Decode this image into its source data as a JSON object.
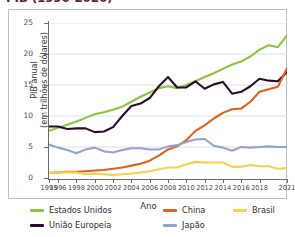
{
  "chart_title": "PIB (1990-2020)",
  "axis": {
    "ylabel": "PIB anual\n(em trilhões de dólares)",
    "xlabel": "Ano",
    "yticks": [
      "0",
      "5",
      "10",
      "15",
      "20",
      "25"
    ],
    "xticks": [
      "1995",
      "1996",
      "1998",
      "2000",
      "2002",
      "2004",
      "2006",
      "2008",
      "2010",
      "2012",
      "2014",
      "2016",
      "2018",
      "2021"
    ]
  },
  "legend": {
    "items": [
      {
        "label": "Estados Unidos",
        "color": "#8CC63F"
      },
      {
        "label": "China",
        "color": "#E2601B"
      },
      {
        "label": "Brasil",
        "color": "#F5D34B"
      },
      {
        "label": "União Europeia",
        "color": "#2B0B2E"
      },
      {
        "label": "Japão",
        "color": "#94A3CC"
      }
    ]
  },
  "chart_data": {
    "type": "line",
    "title": "PIB (1990-2020)",
    "xlabel": "Ano",
    "ylabel": "PIB anual (em trilhões de dólares)",
    "ylim": [
      0,
      25
    ],
    "xlim": [
      1995,
      2021
    ],
    "grid": true,
    "grid_axis": "y",
    "legend_position": "bottom",
    "ytick_values": [
      0,
      5,
      10,
      15,
      20,
      25
    ],
    "xtick_values": [
      1995,
      1996,
      1998,
      2000,
      2002,
      2004,
      2006,
      2008,
      2010,
      2012,
      2014,
      2016,
      2018,
      2021
    ],
    "x": [
      1995,
      1996,
      1997,
      1998,
      1999,
      2000,
      2001,
      2002,
      2003,
      2004,
      2005,
      2006,
      2007,
      2008,
      2009,
      2010,
      2011,
      2012,
      2013,
      2014,
      2015,
      2016,
      2017,
      2018,
      2019,
      2020,
      2021
    ],
    "series": [
      {
        "name": "Estados Unidos",
        "color": "#8CC63F",
        "values": [
          7.6,
          8.1,
          8.6,
          9.1,
          9.7,
          10.3,
          10.6,
          11.0,
          11.5,
          12.3,
          13.1,
          13.8,
          14.5,
          14.8,
          14.5,
          15.0,
          15.6,
          16.3,
          16.9,
          17.6,
          18.3,
          18.8,
          19.6,
          20.7,
          21.4,
          21.1,
          23.0
        ]
      },
      {
        "name": "União Europeia",
        "color": "#2B0B2E",
        "values": [
          8.3,
          8.3,
          7.9,
          8.0,
          8.0,
          7.4,
          7.5,
          8.2,
          10.0,
          11.6,
          12.0,
          12.9,
          14.8,
          16.3,
          14.6,
          14.6,
          15.6,
          14.4,
          15.1,
          15.5,
          13.6,
          13.9,
          14.8,
          16.0,
          15.7,
          15.6,
          17.1
        ]
      },
      {
        "name": "China",
        "color": "#E2601B",
        "values": [
          0.8,
          0.9,
          1.0,
          1.0,
          1.1,
          1.2,
          1.3,
          1.5,
          1.7,
          2.0,
          2.3,
          2.8,
          3.6,
          4.6,
          5.1,
          6.1,
          7.6,
          8.5,
          9.6,
          10.5,
          11.1,
          11.2,
          12.3,
          13.9,
          14.3,
          14.7,
          17.7
        ]
      },
      {
        "name": "Japão",
        "color": "#94A3CC",
        "values": [
          5.4,
          4.9,
          4.5,
          4.0,
          4.6,
          4.9,
          4.3,
          4.1,
          4.5,
          4.8,
          4.8,
          4.6,
          4.6,
          5.1,
          5.3,
          5.8,
          6.2,
          6.3,
          5.2,
          4.9,
          4.4,
          5.0,
          4.9,
          5.0,
          5.1,
          5.0,
          5.0
        ]
      },
      {
        "name": "Brasil",
        "color": "#F5D34B",
        "values": [
          0.8,
          0.9,
          0.9,
          0.9,
          0.6,
          0.7,
          0.6,
          0.5,
          0.6,
          0.7,
          0.9,
          1.1,
          1.4,
          1.7,
          1.7,
          2.2,
          2.6,
          2.5,
          2.5,
          2.5,
          1.8,
          1.8,
          2.1,
          1.9,
          1.9,
          1.5,
          1.6
        ]
      }
    ]
  }
}
